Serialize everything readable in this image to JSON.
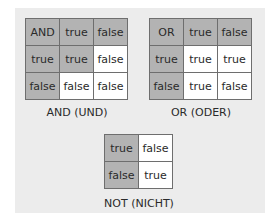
{
  "tables": {
    "and": {
      "caption": "AND (UND)",
      "rows": [
        [
          {
            "text": "AND",
            "shaded": true
          },
          {
            "text": "true",
            "shaded": true
          },
          {
            "text": "false",
            "shaded": true
          }
        ],
        [
          {
            "text": "true",
            "shaded": true
          },
          {
            "text": "true",
            "shaded": true
          },
          {
            "text": "false",
            "shaded": false
          }
        ],
        [
          {
            "text": "false",
            "shaded": true
          },
          {
            "text": "false",
            "shaded": false
          },
          {
            "text": "false",
            "shaded": false
          }
        ]
      ]
    },
    "or": {
      "caption": "OR (ODER)",
      "rows": [
        [
          {
            "text": "OR",
            "shaded": true
          },
          {
            "text": "true",
            "shaded": true
          },
          {
            "text": "false",
            "shaded": true
          }
        ],
        [
          {
            "text": "true",
            "shaded": true
          },
          {
            "text": "true",
            "shaded": false
          },
          {
            "text": "true",
            "shaded": false
          }
        ],
        [
          {
            "text": "false",
            "shaded": true
          },
          {
            "text": "true",
            "shaded": false
          },
          {
            "text": "false",
            "shaded": false
          }
        ]
      ]
    },
    "not": {
      "caption": "NOT (NICHT)",
      "rows": [
        [
          {
            "text": "true",
            "shaded": true
          },
          {
            "text": "false",
            "shaded": false
          }
        ],
        [
          {
            "text": "false",
            "shaded": true
          },
          {
            "text": "true",
            "shaded": false
          }
        ]
      ]
    }
  },
  "colors": {
    "shaded": "#b3b3b3",
    "unshaded": "#ffffff",
    "border": "#6e6e6e",
    "panel": "#ececec"
  }
}
